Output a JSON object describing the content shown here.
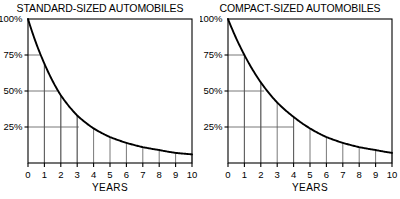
{
  "figure": {
    "background_color": "#ffffff",
    "ink_color": "#000000",
    "grid_color": "#555555"
  },
  "chart_data": [
    {
      "type": "line",
      "title": "STANDARD-SIZED AUTOMOBILES",
      "xlabel": "YEARS",
      "ylabel": "",
      "xlim": [
        0,
        10
      ],
      "ylim": [
        0,
        100
      ],
      "grid": true,
      "legend": "none",
      "x_ticks": [
        "0",
        "1",
        "2",
        "3",
        "4",
        "5",
        "6",
        "7",
        "8",
        "9",
        "10"
      ],
      "y_ticks": [
        "25%",
        "50%",
        "75%",
        "100%"
      ],
      "y_tick_values": [
        25,
        50,
        75,
        100
      ],
      "x": [
        0,
        1,
        2,
        3,
        4,
        5,
        6,
        7,
        8,
        9,
        10
      ],
      "values": [
        100,
        69,
        47,
        33,
        24,
        18,
        14,
        11,
        9,
        7,
        6
      ],
      "gridline_crossings": [
        {
          "percent": 75,
          "year": 0.8
        },
        {
          "percent": 50,
          "year": 1.8
        },
        {
          "percent": 25,
          "year": 3.1
        }
      ],
      "series": [
        {
          "name": "Standard-sized automobile retained value",
          "values": [
            100,
            69,
            47,
            33,
            24,
            18,
            14,
            11,
            9,
            7,
            6
          ]
        }
      ]
    },
    {
      "type": "line",
      "title": "COMPACT-SIZED AUTOMOBILES",
      "xlabel": "YEARS",
      "ylabel": "",
      "xlim": [
        0,
        10
      ],
      "ylim": [
        0,
        100
      ],
      "grid": true,
      "legend": "none",
      "x_ticks": [
        "0",
        "1",
        "2",
        "3",
        "4",
        "5",
        "6",
        "7",
        "8",
        "9",
        "10"
      ],
      "y_ticks": [
        "25%",
        "50%",
        "75%",
        "100%"
      ],
      "y_tick_values": [
        25,
        50,
        75,
        100
      ],
      "x": [
        0,
        1,
        2,
        3,
        4,
        5,
        6,
        7,
        8,
        9,
        10
      ],
      "values": [
        100,
        75,
        56,
        42,
        32,
        24,
        18,
        14,
        11,
        9,
        7
      ],
      "gridline_crossings": [
        {
          "percent": 75,
          "year": 1.0
        },
        {
          "percent": 50,
          "year": 2.2
        },
        {
          "percent": 25,
          "year": 4.0
        }
      ],
      "series": [
        {
          "name": "Compact-sized automobile retained value",
          "values": [
            100,
            75,
            56,
            42,
            32,
            24,
            18,
            14,
            11,
            9,
            7
          ]
        }
      ]
    }
  ]
}
